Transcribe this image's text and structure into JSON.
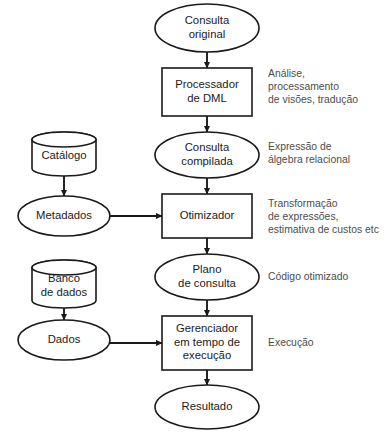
{
  "diagram": {
    "background_color": "#ffffff",
    "stroke_color": "#1a1a1a",
    "annotation_color": "#4d4d4d",
    "nodes": [
      {
        "id": "consulta-original",
        "shape": "ellipse",
        "lines": [
          "Consulta",
          "original"
        ],
        "cx": 207,
        "cy": 28,
        "rx": 52,
        "ry": 24
      },
      {
        "id": "processador-dml",
        "shape": "rect",
        "lines": [
          "Processador",
          "de DML"
        ],
        "x": 162,
        "y": 68,
        "w": 90,
        "h": 48
      },
      {
        "id": "consulta-compilada",
        "shape": "ellipse",
        "lines": [
          "Consulta",
          "compilada"
        ],
        "cx": 207,
        "cy": 155,
        "rx": 52,
        "ry": 23
      },
      {
        "id": "otimizador",
        "shape": "rect",
        "lines": [
          "Otimizador"
        ],
        "x": 162,
        "y": 194,
        "w": 90,
        "h": 44
      },
      {
        "id": "plano-de-consulta",
        "shape": "ellipse",
        "lines": [
          "Plano",
          "de consulta"
        ],
        "cx": 207,
        "cy": 277,
        "rx": 52,
        "ry": 23
      },
      {
        "id": "gerenciador-execucao",
        "shape": "rect",
        "lines": [
          "Gerenciador",
          "em tempo de",
          "execução"
        ],
        "x": 162,
        "y": 316,
        "w": 90,
        "h": 54
      },
      {
        "id": "resultado",
        "shape": "ellipse",
        "lines": [
          "Resultado"
        ],
        "cx": 207,
        "cy": 407,
        "rx": 52,
        "ry": 22
      },
      {
        "id": "catalogo",
        "shape": "cylinder",
        "lines": [
          "Catálogo"
        ],
        "cx": 64,
        "y": 132,
        "w": 64,
        "h": 44
      },
      {
        "id": "metadados",
        "shape": "ellipse",
        "lines": [
          "Metadados"
        ],
        "cx": 64,
        "cy": 216,
        "rx": 46,
        "ry": 20
      },
      {
        "id": "banco-de-dados",
        "shape": "cylinder",
        "lines": [
          "Banco",
          "de dados"
        ],
        "cx": 64,
        "y": 260,
        "w": 64,
        "h": 48
      },
      {
        "id": "dados",
        "shape": "ellipse",
        "lines": [
          "Dados"
        ],
        "cx": 64,
        "cy": 340,
        "rx": 46,
        "ry": 20
      }
    ],
    "edges": [
      {
        "id": "consulta-original-to-processador",
        "from": "consulta-original",
        "to": "processador-dml",
        "orientation": "vertical",
        "x1": 207,
        "y1": 52,
        "x2": 207,
        "y2": 68
      },
      {
        "id": "processador-to-consulta-compilada",
        "from": "processador-dml",
        "to": "consulta-compilada",
        "orientation": "vertical",
        "x1": 207,
        "y1": 116,
        "x2": 207,
        "y2": 132
      },
      {
        "id": "consulta-compilada-to-otimizador",
        "from": "consulta-compilada",
        "to": "otimizador",
        "orientation": "vertical",
        "x1": 207,
        "y1": 178,
        "x2": 207,
        "y2": 194
      },
      {
        "id": "otimizador-to-plano",
        "from": "otimizador",
        "to": "plano-de-consulta",
        "orientation": "vertical",
        "x1": 207,
        "y1": 238,
        "x2": 207,
        "y2": 254
      },
      {
        "id": "plano-to-gerenciador",
        "from": "plano-de-consulta",
        "to": "gerenciador-execucao",
        "orientation": "vertical",
        "x1": 207,
        "y1": 300,
        "x2": 207,
        "y2": 316
      },
      {
        "id": "gerenciador-to-resultado",
        "from": "gerenciador-execucao",
        "to": "resultado",
        "orientation": "vertical",
        "x1": 207,
        "y1": 370,
        "x2": 207,
        "y2": 385
      },
      {
        "id": "catalogo-to-metadados",
        "from": "catalogo",
        "to": "metadados",
        "orientation": "vertical",
        "x1": 64,
        "y1": 176,
        "x2": 64,
        "y2": 196
      },
      {
        "id": "banco-de-dados-to-dados",
        "from": "banco-de-dados",
        "to": "dados",
        "orientation": "vertical",
        "x1": 64,
        "y1": 308,
        "x2": 64,
        "y2": 320
      },
      {
        "id": "metadados-to-otimizador",
        "from": "metadados",
        "to": "otimizador",
        "orientation": "horizontal",
        "x1": 110,
        "y1": 216,
        "x2": 162,
        "y2": 216
      },
      {
        "id": "dados-to-gerenciador",
        "from": "dados",
        "to": "gerenciador-execucao",
        "orientation": "horizontal",
        "x1": 110,
        "y1": 343,
        "x2": 162,
        "y2": 343
      }
    ],
    "annotations": [
      {
        "id": "annot-processador",
        "for": "processador-dml",
        "lines": [
          "Análise,",
          "processamento",
          "de visões, tradução"
        ],
        "x": 268,
        "y": 74
      },
      {
        "id": "annot-consulta-compilada",
        "for": "consulta-compilada",
        "lines": [
          "Expressão de",
          "álgebra relacional"
        ],
        "x": 268,
        "y": 147
      },
      {
        "id": "annot-otimizador",
        "for": "otimizador",
        "lines": [
          "Transformação",
          "de expressões,",
          "estimativa de custos etc"
        ],
        "x": 268,
        "y": 204
      },
      {
        "id": "annot-plano",
        "for": "plano-de-consulta",
        "lines": [
          "Código otimizado"
        ],
        "x": 268,
        "y": 277
      },
      {
        "id": "annot-gerenciador",
        "for": "gerenciador-execucao",
        "lines": [
          "Execução"
        ],
        "x": 268,
        "y": 343
      }
    ]
  }
}
